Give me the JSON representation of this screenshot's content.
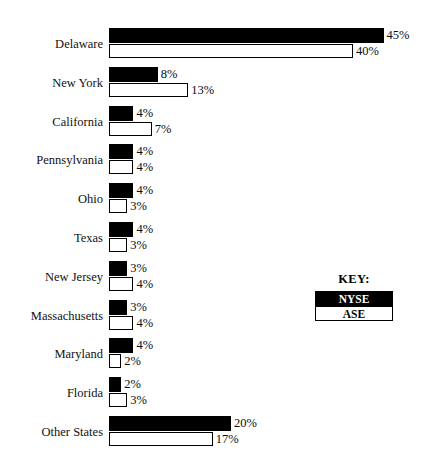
{
  "chart_data": {
    "type": "bar",
    "title": "",
    "subtitle": "",
    "xlabel": "",
    "ylabel": "",
    "orientation": "horizontal",
    "grid": false,
    "xlim": [
      0,
      45
    ],
    "categories": [
      "Delaware",
      "New York",
      "California",
      "Pennsylvania",
      "Ohio",
      "Texas",
      "New Jersey",
      "Massachusetts",
      "Maryland",
      "Florida",
      "Other States"
    ],
    "series": [
      {
        "name": "NYSE",
        "color": "#000000",
        "values": [
          45,
          8,
          4,
          4,
          4,
          4,
          3,
          3,
          4,
          2,
          20
        ],
        "labels": [
          "45%",
          "8%",
          "4%",
          "4%",
          "4%",
          "4%",
          "3%",
          "3%",
          "4%",
          "2%",
          "20%"
        ]
      },
      {
        "name": "ASE",
        "color": "#ffffff",
        "values": [
          40,
          13,
          7,
          4,
          3,
          3,
          4,
          4,
          2,
          3,
          17
        ],
        "labels": [
          "40%",
          "13%",
          "7%",
          "4%",
          "3%",
          "3%",
          "4%",
          "4%",
          "2%",
          "3%",
          "17%"
        ]
      }
    ],
    "legend": {
      "position": "right",
      "title": "KEY:",
      "entries": [
        {
          "label": "NYSE",
          "color": "#000000"
        },
        {
          "label": "ASE",
          "color": "#ffffff"
        }
      ]
    }
  }
}
